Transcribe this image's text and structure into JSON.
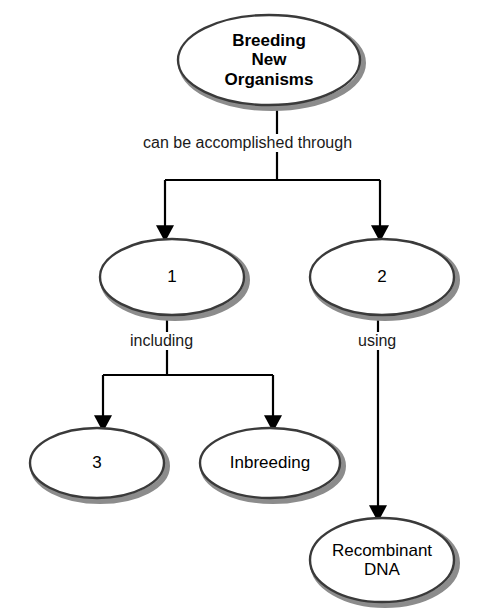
{
  "diagram": {
    "title": "Breeding New Organisms",
    "type": "concept-map",
    "colors": {
      "ellipse_outline": "#3a3a3a",
      "ellipse_shadow": "#8c8c8c",
      "ellipse_fill": "#ffffff",
      "connector": "#000000",
      "text": "#000000",
      "background": "#ffffff"
    },
    "nodes": [
      {
        "id": "root",
        "label": "Breeding\nNew\nOrganisms",
        "bold": true,
        "cx": 269,
        "cy": 60,
        "rx": 91,
        "ry": 45,
        "font_size": 17
      },
      {
        "id": "blank1",
        "label": "1",
        "bold": false,
        "cx": 172,
        "cy": 277,
        "rx": 72,
        "ry": 38,
        "font_size": 17
      },
      {
        "id": "blank2",
        "label": "2",
        "bold": false,
        "cx": 382,
        "cy": 277,
        "rx": 72,
        "ry": 38,
        "font_size": 17
      },
      {
        "id": "blank3",
        "label": "3",
        "bold": false,
        "cx": 97,
        "cy": 463,
        "rx": 67,
        "ry": 35,
        "font_size": 17
      },
      {
        "id": "inbreeding",
        "label": "Inbreeding",
        "bold": false,
        "cx": 270,
        "cy": 463,
        "rx": 70,
        "ry": 35,
        "font_size": 17
      },
      {
        "id": "recombinant",
        "label": "Recombinant\nDNA",
        "bold": false,
        "cx": 382,
        "cy": 560,
        "rx": 72,
        "ry": 42,
        "font_size": 17
      }
    ],
    "edge_labels": [
      {
        "id": "edge-label-root",
        "text": "can be accomplished through",
        "x": 141,
        "y": 134,
        "font_size": 16
      },
      {
        "id": "edge-label-including",
        "text": "including",
        "x": 127,
        "y": 332,
        "font_size": 16
      },
      {
        "id": "edge-label-using",
        "text": "using",
        "x": 355,
        "y": 332,
        "font_size": 16
      }
    ],
    "connectors": [
      {
        "id": "root-to-split",
        "from": "root",
        "to": "branch-bar-1"
      },
      {
        "id": "split-to-blank1",
        "from": "branch-bar-1",
        "to": "blank1",
        "arrow": true
      },
      {
        "id": "split-to-blank2",
        "from": "branch-bar-1",
        "to": "blank2",
        "arrow": true
      },
      {
        "id": "blank1-to-split2",
        "from": "blank1",
        "to": "branch-bar-2"
      },
      {
        "id": "split2-to-blank3",
        "from": "branch-bar-2",
        "to": "blank3",
        "arrow": true
      },
      {
        "id": "split2-to-inbreeding",
        "from": "branch-bar-2",
        "to": "inbreeding",
        "arrow": true
      },
      {
        "id": "blank2-to-recombinant",
        "from": "blank2",
        "to": "recombinant",
        "arrow": true
      }
    ]
  }
}
